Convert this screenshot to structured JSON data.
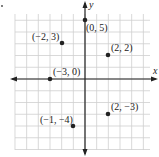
{
  "chart_data": {
    "type": "scatter",
    "title": "",
    "xlabel": "x",
    "ylabel": "y",
    "xlim": [
      -6,
      5
    ],
    "ylim": [
      -6,
      6
    ],
    "grid": true,
    "legend": null,
    "points": [
      {
        "x": 0,
        "y": 5,
        "label": "(0, 5)"
      },
      {
        "x": -2,
        "y": 3,
        "label": "(−2, 3)"
      },
      {
        "x": 2,
        "y": 2,
        "label": "(2, 2)"
      },
      {
        "x": -3,
        "y": 0,
        "label": "(−3, 0)"
      },
      {
        "x": 2,
        "y": -3,
        "label": "(2, −3)"
      },
      {
        "x": -1,
        "y": -4,
        "label": "(−1, −4)"
      }
    ]
  },
  "axes": {
    "x_label": "x",
    "y_label": "y"
  },
  "style": {
    "grid_color": "#cfcfcf",
    "axis_color": "#222222",
    "point_color": "#222222"
  }
}
